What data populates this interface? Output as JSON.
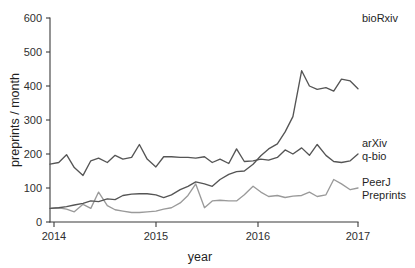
{
  "figure": {
    "background": "#ffffff",
    "width": 415,
    "height": 268
  },
  "axes": {
    "y_title": "preprints / month",
    "x_title": "year",
    "y_ticks": [
      "0",
      "100",
      "200",
      "300",
      "400",
      "500",
      "600"
    ],
    "x_ticks": [
      "2014",
      "2015",
      "2016",
      "2017"
    ],
    "axis_color": "#3b3b3b"
  },
  "series_labels": {
    "biorxiv": "bioRxiv",
    "arxiv_line1": "arXiv",
    "arxiv_line2": "q-bio",
    "peerj_line1": "PeerJ",
    "peerj_line2": "Preprints"
  },
  "colors": {
    "biorxiv": "#555555",
    "arxiv": "#555555",
    "peerj": "#9a9a9a",
    "axis": "#3b3b3b",
    "text": "#1f1f1f"
  },
  "chart_data": {
    "type": "line",
    "title": "",
    "subtitle": "",
    "xlabel": "year",
    "ylabel": "preprints / month",
    "xlim": [
      2013.83,
      2017.0
    ],
    "ylim": [
      0,
      600
    ],
    "yticks": [
      0,
      100,
      200,
      300,
      400,
      500,
      600
    ],
    "xticks": [
      2014,
      2015,
      2016,
      2017
    ],
    "grid": false,
    "legend_position": "right-inline-labels",
    "annotations": [
      {
        "text": "bioRxiv",
        "x": 2017.0,
        "y": 580
      },
      {
        "text": "arXiv q-bio",
        "x": 2017.0,
        "y": 200
      },
      {
        "text": "PeerJ Preprints",
        "x": 2017.0,
        "y": 100
      }
    ],
    "x": [
      2013.83,
      2013.92,
      2014.0,
      2014.08,
      2014.17,
      2014.25,
      2014.33,
      2014.42,
      2014.5,
      2014.58,
      2014.67,
      2014.75,
      2014.83,
      2014.92,
      2015.0,
      2015.08,
      2015.17,
      2015.25,
      2015.33,
      2015.42,
      2015.5,
      2015.58,
      2015.67,
      2015.75,
      2015.83,
      2015.92,
      2016.0,
      2016.08,
      2016.17,
      2016.25,
      2016.33,
      2016.42,
      2016.5,
      2016.58,
      2016.67,
      2016.75,
      2016.83,
      2016.92,
      2017.0
    ],
    "series": [
      {
        "name": "bioRxiv",
        "color": "#555555",
        "values": [
          40,
          42,
          45,
          50,
          55,
          62,
          60,
          68,
          66,
          78,
          82,
          83,
          83,
          80,
          72,
          80,
          95,
          105,
          118,
          112,
          105,
          125,
          140,
          148,
          150,
          170,
          195,
          215,
          230,
          265,
          310,
          445,
          400,
          390,
          395,
          385,
          420,
          415,
          392
        ],
        "note": "continues: 385, 448, 440, 445, 455, 460, 500, 560, 580"
      },
      {
        "name": "arXiv q-bio",
        "color": "#555555",
        "values": [
          170,
          175,
          198,
          160,
          137,
          180,
          188,
          175,
          196,
          185,
          190,
          228,
          185,
          162,
          192,
          192,
          190,
          190,
          188,
          192,
          175,
          185,
          172,
          215,
          178,
          180,
          185,
          182,
          190,
          212,
          200,
          218,
          196,
          228,
          196,
          178,
          175,
          180,
          200
        ],
        "note": "oscillates 135-230 throughout, ends near 200"
      },
      {
        "name": "PeerJ Preprints",
        "color": "#9a9a9a",
        "values": [
          40,
          42,
          38,
          30,
          52,
          40,
          88,
          48,
          36,
          32,
          28,
          28,
          30,
          32,
          38,
          42,
          56,
          78,
          112,
          42,
          62,
          64,
          62,
          62,
          80,
          105,
          88,
          75,
          78,
          72,
          76,
          78,
          88,
          75,
          80,
          125,
          112,
          95,
          100
        ],
        "note": "light gray lower trace, peaks near 130, ends near 100"
      }
    ]
  },
  "geometry": {
    "plot_left": 50,
    "plot_right": 358,
    "plot_top": 18,
    "plot_bottom": 222
  }
}
